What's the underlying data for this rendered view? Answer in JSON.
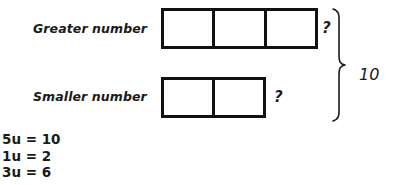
{
  "diagram": {
    "type": "bar-model",
    "title_text": "",
    "rows": [
      {
        "label": "Greater number",
        "units": 3,
        "unknown_marker": "?"
      },
      {
        "label": "Smaller number",
        "units": 2,
        "unknown_marker": "?"
      }
    ],
    "brace": {
      "label": "10",
      "spans_rows": [
        0,
        1
      ],
      "orientation": "right"
    },
    "working": [
      "5u = 10",
      "1u = 2",
      "3u = 6"
    ],
    "colors": {
      "ink": "#111111",
      "text": "#1a1a1a",
      "background": "#ffffff"
    }
  }
}
